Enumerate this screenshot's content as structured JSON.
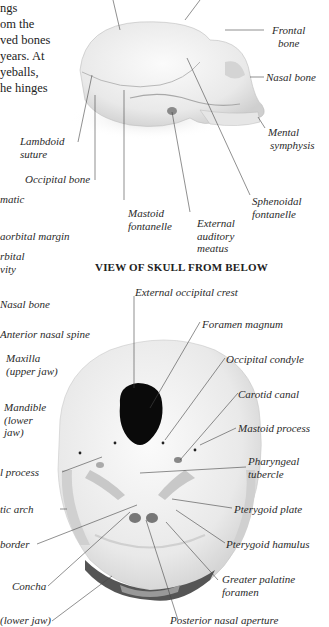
{
  "intro_text": {
    "lines": [
      "ngs",
      "om the",
      "ved bones",
      "years. At",
      "yeballs,",
      "he hinges"
    ]
  },
  "side_view": {
    "labels": {
      "frontal_bone": [
        "Frontal",
        "bone"
      ],
      "nasal_bone": "Nasal bone",
      "mental_symphysis": [
        "Mental",
        "symphysis"
      ],
      "lambdoid_suture": [
        "Lambdoid",
        "suture"
      ],
      "occipital_bone": "Occipital bone",
      "zygomatic": "matic",
      "mastoid_fontanelle": [
        "Mastoid",
        "fontanelle"
      ],
      "external_auditory_meatus": [
        "External",
        "auditory",
        "meatus"
      ],
      "sphenoidal_fontanelle": [
        "Sphenoidal",
        "fontanelle"
      ],
      "infraorbital_margin": "aorbital margin",
      "orbital_cavity": [
        "rbital",
        "vity"
      ]
    }
  },
  "below_view": {
    "title": "VIEW OF SKULL FROM BELOW",
    "labels": {
      "nasal_bone": "Nasal bone",
      "anterior_nasal_spine": "Anterior nasal spine",
      "maxilla": [
        "Maxilla",
        "(upper jaw)"
      ],
      "mandible": [
        "Mandible",
        "(lower",
        "jaw)"
      ],
      "styloid_process": "l process",
      "zygomatic_arch": "tic arch",
      "border": "border",
      "concha": "Concha",
      "lower_jaw": "(lower jaw)",
      "external_occipital_crest": "External occipital crest",
      "foramen_magnum": "Foramen magnum",
      "occipital_condyle": "Occipital condyle",
      "carotid_canal": "Carotid canal",
      "mastoid_process": "Mastoid process",
      "pharyngeal_tubercle": [
        "Pharyngeal",
        "tubercle"
      ],
      "pterygoid_plate": "Pterygoid plate",
      "pterygoid_hamulus": "Pterygoid hamulus",
      "greater_palatine_foramen": [
        "Greater palatine",
        "foramen"
      ],
      "posterior_nasal_aperture": "Posterior nasal aperture"
    }
  }
}
